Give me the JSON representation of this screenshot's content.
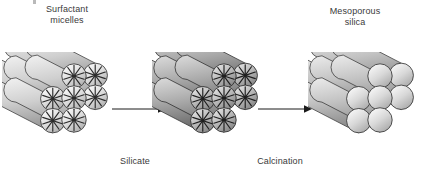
{
  "diagram": {
    "background_color": "#ffffff",
    "text_color": "#3a3a3a",
    "labels": {
      "surfactant_micelles": "Surfactant\nmicelles",
      "mesoporous_silica": "Mesoporous\nsilica",
      "silicate": "Silicate",
      "calcination": "Calcination"
    },
    "stages": [
      {
        "id": "micelles",
        "name": "surfactant-micelle-cluster",
        "caption_above": "Surfactant\nmicelles",
        "cylinder_count": 7,
        "packing": "hexagonal",
        "pore_fill": "micelle-asterisk",
        "asterisk_spokes": 10,
        "tone": "light",
        "body_gradient": [
          "#f2f2f2",
          "#cfcfcf",
          "#9a9a9a"
        ],
        "cap_gradient": [
          "#fdfdfd",
          "#dcdcdc",
          "#a8a8a8"
        ],
        "outline_color": "#2b2b2b"
      },
      {
        "id": "silicate",
        "name": "silicate-coated-cluster",
        "caption_below": "Silicate",
        "cylinder_count": 7,
        "packing": "hexagonal",
        "pore_fill": "micelle-asterisk",
        "asterisk_spokes": 10,
        "tone": "dark",
        "body_gradient": [
          "#dcdcdc",
          "#a9a9a9",
          "#6f6f6f"
        ],
        "cap_gradient": [
          "#e8e8e8",
          "#b6b6b6",
          "#7d7d7d"
        ],
        "outline_color": "#1f1f1f"
      },
      {
        "id": "mesoporous",
        "name": "mesoporous-silica-cluster",
        "caption_above": "Mesoporous\nsilica",
        "cylinder_count": 7,
        "packing": "hexagonal",
        "pore_fill": "empty",
        "asterisk_spokes": 0,
        "tone": "medium",
        "body_gradient": [
          "#ececec",
          "#c2c2c2",
          "#8d8d8d"
        ],
        "cap_gradient": [
          "#fbfbfb",
          "#d8d8d8",
          "#a4a4a4"
        ],
        "outline_color": "#2b2b2b"
      }
    ],
    "arrows": [
      {
        "id": "arrow-1",
        "name": "arrow-silicate",
        "label": "Silicate",
        "direction": "right",
        "length": 52
      },
      {
        "id": "arrow-2",
        "name": "arrow-calcination",
        "label": "Calcination",
        "direction": "right",
        "length": 52
      }
    ],
    "arrow_color": "#1a1a1a"
  }
}
